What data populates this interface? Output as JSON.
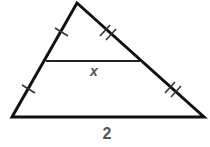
{
  "diagram": {
    "type": "triangle-midsegment",
    "labels": {
      "midsegment": "x",
      "base": "2"
    },
    "colors": {
      "stroke": "#111111",
      "label": "#555555",
      "background": "#ffffff"
    },
    "tick_marks": {
      "left_side": "single tick on each half",
      "right_side": "double tick on each half"
    }
  }
}
